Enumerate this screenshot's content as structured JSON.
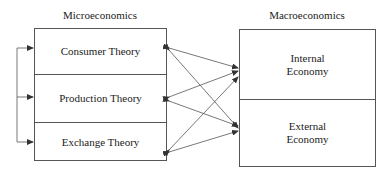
{
  "left_group": {
    "title": "Microeconomics",
    "items": [
      {
        "label": "Consumer Theory"
      },
      {
        "label": "Production Theory"
      },
      {
        "label": "Exchange Theory"
      }
    ]
  },
  "right_group": {
    "title": "Macroeconomics",
    "items": [
      {
        "label": "Internal\nEconomy",
        "line1": "Internal",
        "line2": "Economy"
      },
      {
        "label": "External\nEconomy",
        "line1": "External",
        "line2": "Economy"
      }
    ]
  },
  "connections": [
    {
      "from": "Consumer Theory",
      "to": "Internal Economy",
      "type": "bidirectional"
    },
    {
      "from": "Consumer Theory",
      "to": "External Economy",
      "type": "bidirectional"
    },
    {
      "from": "Production Theory",
      "to": "Internal Economy",
      "type": "bidirectional"
    },
    {
      "from": "Production Theory",
      "to": "External Economy",
      "type": "bidirectional"
    },
    {
      "from": "Exchange Theory",
      "to": "Internal Economy",
      "type": "bidirectional"
    },
    {
      "from": "Exchange Theory",
      "to": "External Economy",
      "type": "bidirectional"
    }
  ],
  "feedback_bracket": {
    "description": "Left bracket with arrows pointing into each microeconomic theory",
    "targets": [
      "Consumer Theory",
      "Production Theory",
      "Exchange Theory"
    ]
  },
  "colors": {
    "line": "#555555",
    "text": "#222222",
    "background": "#ffffff"
  }
}
